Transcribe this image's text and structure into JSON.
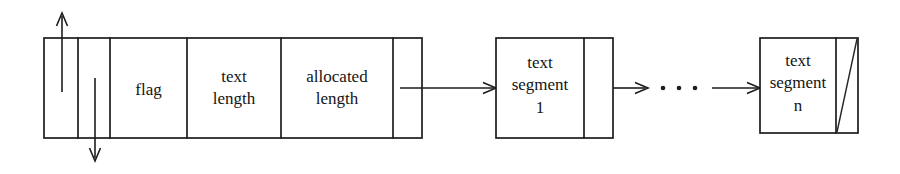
{
  "figure": {
    "background_color": "#ffffff",
    "stroke_color": "#1d1d1d",
    "text_color": "#141414"
  },
  "header_block": {
    "name": "string-header-block",
    "cells": [
      {
        "id": "prev-pointer-cell",
        "label": "",
        "has_up_arrow": true
      },
      {
        "id": "next-pointer-cell",
        "label": "",
        "has_down_arrow": true
      },
      {
        "id": "flag-cell",
        "label": "flag"
      },
      {
        "id": "text-length-cell",
        "label": "text\nlength"
      },
      {
        "id": "allocated-length-cell",
        "label": "allocated\nlength"
      },
      {
        "id": "segment-pointer-cell",
        "label": ""
      }
    ]
  },
  "arrows": {
    "up_arrow": {
      "name": "up-arrow",
      "direction": "up"
    },
    "down_arrow": {
      "name": "down-arrow",
      "direction": "down"
    },
    "header_to_segment1": {
      "name": "pointer-arrow-header-to-segment-1",
      "direction": "right"
    },
    "segment1_to_ellipsis": {
      "name": "pointer-arrow-segment-1-to-ellipsis",
      "direction": "right"
    },
    "ellipsis_to_segmentn": {
      "name": "pointer-arrow-ellipsis-to-segment-n",
      "direction": "right"
    }
  },
  "ellipsis": {
    "name": "ellipsis-dots",
    "label": "· · ·",
    "dot_count": 3
  },
  "segments": [
    {
      "id": "text-segment-1",
      "label": "text\nsegment\n1",
      "pointer_cell": {
        "id": "segment-1-next-pointer",
        "null_pointer": false
      }
    },
    {
      "id": "text-segment-n",
      "label": "text\nsegment\nn",
      "pointer_cell": {
        "id": "segment-n-next-pointer",
        "null_pointer": true
      }
    }
  ]
}
